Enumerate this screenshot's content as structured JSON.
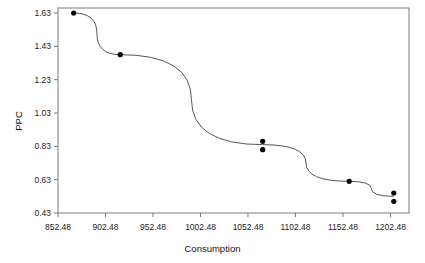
{
  "chart_data": {
    "type": "line",
    "title": "",
    "xlabel": "Consumption",
    "ylabel": "PPC",
    "xlim": [
      852.48,
      1222.0
    ],
    "ylim": [
      0.43,
      1.66
    ],
    "grid": false,
    "legend": "none",
    "marker": "filled-circle",
    "line_color": "#555555",
    "marker_color": "#000000",
    "frame_color": "#7a7a7a",
    "background": "#ffffff",
    "xticks": [
      852.48,
      902.48,
      952.48,
      1002.48,
      1052.48,
      1102.48,
      1152.48,
      1202.48
    ],
    "xtick_labels": [
      "852.48",
      "902.48",
      "952.48",
      "1002.48",
      "1052.48",
      "1102.48",
      "1152.48",
      "1202.48"
    ],
    "yticks": [
      0.43,
      0.63,
      0.83,
      1.03,
      1.23,
      1.43,
      1.63
    ],
    "ytick_labels": [
      "0.43",
      "0.63",
      "0.83",
      "1.03",
      "1.23",
      "1.43",
      "1.63"
    ],
    "series": [
      {
        "name": "PPC vs Consumption",
        "x": [
          869.0,
          918.0,
          1068.0,
          1068.0,
          1159.0,
          1206.0,
          1206.0
        ],
        "y": [
          1.63,
          1.38,
          0.86,
          0.81,
          0.62,
          0.55,
          0.5
        ]
      }
    ],
    "line_path_x": [
      869.0,
      918.0,
      1068.0,
      1159.0,
      1206.0
    ],
    "line_path_y": [
      1.63,
      1.38,
      0.84,
      0.62,
      0.53
    ]
  }
}
